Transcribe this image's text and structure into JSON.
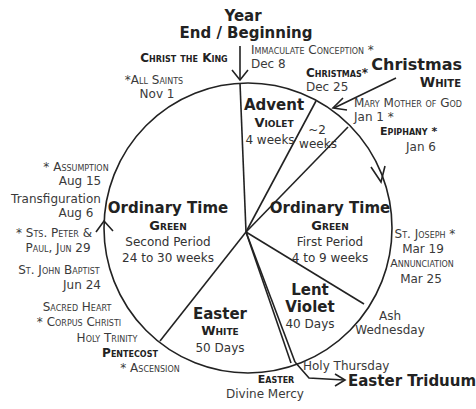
{
  "header": {
    "year_line1": "Year",
    "year_line2": "End / Beginning"
  },
  "labels": {
    "christ_the_king": "Christ the King",
    "all_saints": "*All Saints",
    "all_saints_date": "Nov 1",
    "immaculate_conception": "Immaculate Conception *",
    "immaculate_conception_date": "Dec 8",
    "christmas_feast": "Christmas*",
    "christmas_feast_date": "Dec 25",
    "christmas_season": "Christmas",
    "christmas_color": "White",
    "mary_mother": "Mary Mother of God",
    "mary_mother_date": "Jan 1 *",
    "epiphany": "Epiphany *",
    "epiphany_date": "Jan 6",
    "st_joseph": "St. Joseph *",
    "st_joseph_date": "Mar 19",
    "annunciation": "Annunciation",
    "annunciation_date": "Mar 25",
    "ash_wednesday_1": "Ash",
    "ash_wednesday_2": "Wednesday",
    "holy_thursday": "Holy Thursday",
    "easter_triduum": "Easter Triduum",
    "easter_feast": "Easter",
    "divine_mercy": "Divine Mercy",
    "ascension": "* Ascension",
    "pentecost": "Pentecost",
    "holy_trinity": "Holy Trinity",
    "corpus_christi": "* Corpus Christi",
    "sacred_heart": "Sacred Heart",
    "john_baptist": "St. John Baptist",
    "john_baptist_date": "Jun 24",
    "peter_paul_1": "* Sts. Peter &",
    "peter_paul_2": "Paul,  Jun 29",
    "transfiguration": "Transfiguration",
    "transfiguration_date": "Aug 6",
    "assumption": "* Assumption",
    "assumption_date": "Aug 15"
  },
  "segments": {
    "advent": {
      "title": "Advent",
      "color": "Violet",
      "duration": "4 weeks"
    },
    "christmas": {
      "duration_1": "~2",
      "duration_2": "weeks"
    },
    "ordinary_first": {
      "title": "Ordinary Time",
      "color": "Green",
      "period": "First Period",
      "duration": "4 to 9 weeks"
    },
    "lent": {
      "title": "Lent",
      "color": "Violet",
      "duration": "40 Days"
    },
    "easter": {
      "title": "Easter",
      "color": "White",
      "duration": "50 Days"
    },
    "ordinary_second": {
      "title": "Ordinary Time",
      "color": "Green",
      "period": "Second Period",
      "duration": "24 to 30 weeks"
    }
  },
  "colors": {
    "line": "#222222",
    "text": "#333333"
  }
}
